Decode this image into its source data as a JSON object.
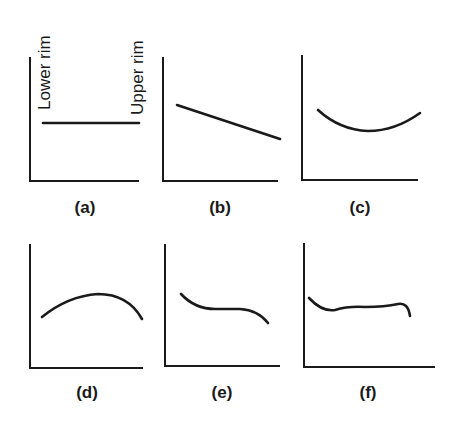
{
  "figure": {
    "axis_labels": {
      "left": "Lower rim",
      "right": "Upper rim"
    },
    "panels": [
      {
        "id": "a",
        "label": "(a)",
        "shape": "flat"
      },
      {
        "id": "b",
        "label": "(b)",
        "shape": "linear decreasing"
      },
      {
        "id": "c",
        "label": "(c)",
        "shape": "concave up (U-shaped)"
      },
      {
        "id": "d",
        "label": "(d)",
        "shape": "concave down (arch)"
      },
      {
        "id": "e",
        "label": "(e)",
        "shape": "decreasing with plateau"
      },
      {
        "id": "f",
        "label": "(f)",
        "shape": "wavy plateau"
      }
    ]
  },
  "colors": {
    "ink": "#1a1a1a",
    "background": "#ffffff"
  }
}
